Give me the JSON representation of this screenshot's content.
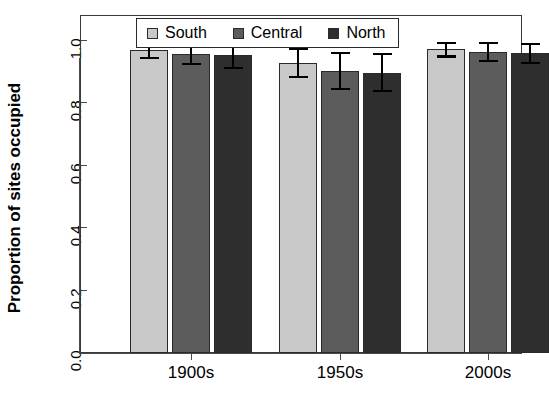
{
  "chart_data": {
    "type": "bar",
    "title": "",
    "xlabel": "",
    "ylabel": "Proportion of sites occupied",
    "categories": [
      "1900s",
      "1950s",
      "2000s"
    ],
    "ylim": [
      0.0,
      1.08
    ],
    "yticks": [
      0.0,
      0.2,
      0.4,
      0.6,
      0.8,
      1.0
    ],
    "ytick_labels": [
      "0.0",
      "0.2",
      "0.4",
      "0.6",
      "0.8",
      "1.0"
    ],
    "grid": false,
    "legend_position": "top-center",
    "error_bar_type": "95% confidence interval",
    "series": [
      {
        "name": "South",
        "color": "#c9c9c9",
        "values": [
          0.97,
          0.93,
          0.973
        ],
        "err_low": [
          0.943,
          0.88,
          0.947
        ],
        "err_high": [
          0.998,
          0.978,
          0.997
        ]
      },
      {
        "name": "Central",
        "color": "#5c5c5c",
        "values": [
          0.957,
          0.903,
          0.965
        ],
        "err_low": [
          0.922,
          0.842,
          0.932
        ],
        "err_high": [
          0.991,
          0.965,
          0.997
        ]
      },
      {
        "name": "North",
        "color": "#2e2e2e",
        "values": [
          0.955,
          0.898,
          0.96
        ],
        "err_low": [
          0.91,
          0.835,
          0.925
        ],
        "err_high": [
          1.0,
          0.963,
          0.995
        ]
      }
    ]
  },
  "legend": {
    "items": [
      {
        "label": "South",
        "color": "#c9c9c9"
      },
      {
        "label": "Central",
        "color": "#5c5c5c"
      },
      {
        "label": "North",
        "color": "#2e2e2e"
      }
    ]
  },
  "axes": {
    "y_title": "Proportion of sites occupied",
    "y_tick_labels": [
      "0.0",
      "0.2",
      "0.4",
      "0.6",
      "0.8",
      "1.0"
    ],
    "x_tick_labels": [
      "1900s",
      "1950s",
      "2000s"
    ]
  }
}
